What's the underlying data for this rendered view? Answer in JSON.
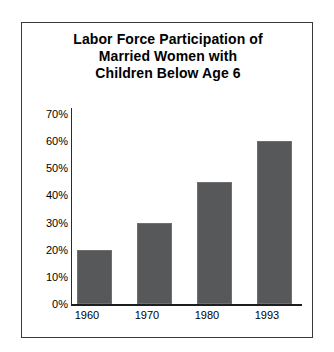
{
  "chart_data": {
    "type": "bar",
    "title": "Labor Force Participation of Married Women with Children Below Age 6",
    "title_lines": [
      "Labor Force Participation of",
      "Married Women with",
      "Children Below Age 6"
    ],
    "categories": [
      "1960",
      "1970",
      "1980",
      "1993"
    ],
    "values": [
      20,
      30,
      45,
      60
    ],
    "value_labels": [
      "20%",
      "30%",
      "45%",
      "60%"
    ],
    "xlabel": "",
    "ylabel": "",
    "ylim": [
      0,
      70
    ],
    "ytick_values": [
      70,
      60,
      50,
      40,
      30,
      20,
      10,
      0
    ],
    "ytick_labels": [
      "70%",
      "60%",
      "50%",
      "40%",
      "30%",
      "20%",
      "10%",
      "0%"
    ],
    "grid": false,
    "legend": false,
    "bar_color": "#57585A",
    "axis_color": "#1D1D1F",
    "background_color": "#FFFFFF",
    "frame_color": "#3A3A3C"
  }
}
